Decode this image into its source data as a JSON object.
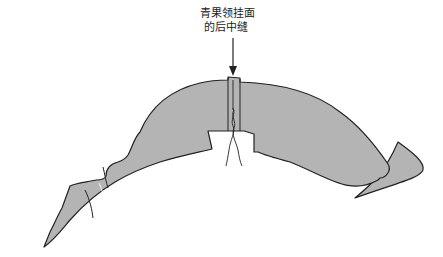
{
  "diagram": {
    "type": "illustration",
    "annotation": {
      "line1": "青果领挂面",
      "line2": "的后中缝"
    },
    "colors": {
      "fill": "#b4b4b4",
      "stroke": "#222222",
      "background": "#ffffff"
    }
  }
}
